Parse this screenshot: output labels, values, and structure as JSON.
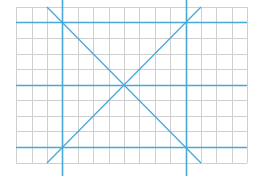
{
  "diagram": {
    "title": "",
    "colors": {
      "background": "#ffffff",
      "grid": "#cfcfcf",
      "guide": "#4aa8d8"
    },
    "grid": {
      "x_lines": [
        16,
        32,
        47,
        62,
        78,
        93,
        109,
        124,
        139,
        155,
        170,
        186,
        201,
        216,
        232,
        247
      ],
      "y_lines": [
        7,
        22,
        38,
        54,
        69,
        85,
        100,
        116,
        131,
        147,
        163
      ],
      "left": 16,
      "right": 247,
      "top": 7,
      "bottom": 163
    },
    "guides": {
      "vertical": [
        62,
        186
      ],
      "horizontal": [
        22,
        85,
        147
      ],
      "diagonals": [
        {
          "x1": 47,
          "y1": 7,
          "x2": 201,
          "y2": 163
        },
        {
          "x1": 201,
          "y1": 7,
          "x2": 47,
          "y2": 163
        }
      ]
    }
  }
}
